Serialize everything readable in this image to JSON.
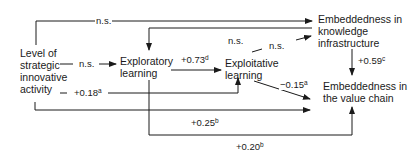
{
  "nodes": {
    "level": {
      "lines": [
        "Level of",
        "strategic",
        "innovative",
        "activity"
      ]
    },
    "exploratory": {
      "lines": [
        "Exploratory",
        "learning"
      ]
    },
    "exploitative": {
      "lines": [
        "Exploitative",
        "learning"
      ]
    },
    "knowledge": {
      "lines": [
        "Embeddedness in",
        "knowledge",
        "infrastructure"
      ]
    },
    "valuechain": {
      "lines": [
        "Embeddedness in",
        "the value chain"
      ]
    }
  },
  "edges": {
    "level_to_knowledge": {
      "value": "n.s.",
      "sup": ""
    },
    "level_to_exploratory": {
      "value": "n.s.",
      "sup": ""
    },
    "exploratory_to_exploitative": {
      "value": "+0.73",
      "sup": "d"
    },
    "knowledge_to_exploratory": {
      "value": "n.s.",
      "sup": ""
    },
    "exploitative_to_knowledge": {
      "value": "n.s.",
      "sup": ""
    },
    "knowledge_to_valuechain": {
      "value": "+0.59",
      "sup": "c"
    },
    "level_to_exploitative": {
      "value": "+0.18",
      "sup": "a"
    },
    "exploitative_to_valuechain": {
      "value": "−0.15",
      "sup": "a"
    },
    "level_to_valuechain": {
      "value": "+0.25",
      "sup": "b"
    },
    "exploratory_to_valuechain": {
      "value": "+0.20",
      "sup": "b"
    }
  },
  "colors": {
    "line": "#1a1a1a",
    "background": "#ffffff"
  }
}
